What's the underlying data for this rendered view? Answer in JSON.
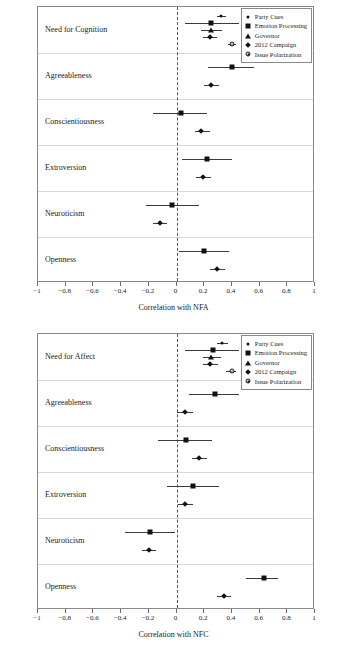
{
  "figure": {
    "legend_entries": [
      {
        "label": "Party Cues",
        "marker": "dot"
      },
      {
        "label": "Emotion Processing",
        "marker": "square"
      },
      {
        "label": "Governor",
        "marker": "triangle"
      },
      {
        "label": "2012 Campaign",
        "marker": "diamond"
      },
      {
        "label": "Issue Polarization",
        "marker": "open-circle"
      }
    ],
    "marker_color": "#111111",
    "grid_color": "#d8d8d8",
    "zero_line_color": "#555555"
  },
  "chart_data": [
    {
      "type": "scatter",
      "title": "",
      "xlabel": "Correlation with NFA",
      "ylabel": "Personality Trait Variable",
      "xlim": [
        -1,
        1
      ],
      "xticks": [
        -1,
        -0.8,
        -0.6,
        -0.4,
        -0.2,
        0,
        0.2,
        0.4,
        0.6,
        0.8,
        1
      ],
      "xticklabels": [
        "−1",
        "−0.8",
        "−0.6",
        "−0.4",
        "−0.2",
        "0",
        "0.2",
        "0.4",
        "0.6",
        "0.8",
        "1"
      ],
      "grid": true,
      "legend_position": "top-right",
      "groups": [
        {
          "label": "Need for Cognition",
          "points": [
            {
              "series": "Party Cues",
              "marker": "dot",
              "value": 0.32,
              "ci_low": 0.29,
              "ci_high": 0.36
            },
            {
              "series": "Emotion Processing",
              "marker": "square",
              "value": 0.25,
              "ci_low": 0.06,
              "ci_high": 0.45
            },
            {
              "series": "Governor",
              "marker": "triangle",
              "value": 0.25,
              "ci_low": 0.18,
              "ci_high": 0.33
            },
            {
              "series": "2012 Campaign",
              "marker": "diamond",
              "value": 0.24,
              "ci_low": 0.19,
              "ci_high": 0.29
            },
            {
              "series": "Issue Polarization",
              "marker": "open-circle",
              "value": 0.4,
              "ci_low": 0.37,
              "ci_high": 0.43
            }
          ]
        },
        {
          "label": "Agreeableness",
          "points": [
            {
              "series": "Emotion Processing",
              "marker": "square",
              "value": 0.4,
              "ci_low": 0.23,
              "ci_high": 0.56
            },
            {
              "series": "2012 Campaign",
              "marker": "diamond",
              "value": 0.25,
              "ci_low": 0.2,
              "ci_high": 0.31
            }
          ]
        },
        {
          "label": "Conscientiousness",
          "points": [
            {
              "series": "Emotion Processing",
              "marker": "square",
              "value": 0.03,
              "ci_low": -0.17,
              "ci_high": 0.22
            },
            {
              "series": "2012 Campaign",
              "marker": "diamond",
              "value": 0.18,
              "ci_low": 0.13,
              "ci_high": 0.24
            }
          ]
        },
        {
          "label": "Extroversion",
          "points": [
            {
              "series": "Emotion Processing",
              "marker": "square",
              "value": 0.22,
              "ci_low": 0.04,
              "ci_high": 0.4
            },
            {
              "series": "2012 Campaign",
              "marker": "diamond",
              "value": 0.19,
              "ci_low": 0.14,
              "ci_high": 0.25
            }
          ]
        },
        {
          "label": "Neuroticism",
          "points": [
            {
              "series": "Emotion Processing",
              "marker": "square",
              "value": -0.03,
              "ci_low": -0.22,
              "ci_high": 0.16
            },
            {
              "series": "2012 Campaign",
              "marker": "diamond",
              "value": -0.12,
              "ci_low": -0.17,
              "ci_high": -0.07
            }
          ]
        },
        {
          "label": "Openness",
          "points": [
            {
              "series": "Emotion Processing",
              "marker": "square",
              "value": 0.2,
              "ci_low": 0.02,
              "ci_high": 0.38
            },
            {
              "series": "2012 Campaign",
              "marker": "diamond",
              "value": 0.29,
              "ci_low": 0.24,
              "ci_high": 0.35
            }
          ]
        }
      ]
    },
    {
      "type": "scatter",
      "title": "",
      "xlabel": "Correlation with NFC",
      "ylabel": "Personality Trait Variable",
      "xlim": [
        -1,
        1
      ],
      "xticks": [
        -1,
        -0.8,
        -0.6,
        -0.4,
        -0.2,
        0,
        0.2,
        0.4,
        0.6,
        0.8,
        1
      ],
      "xticklabels": [
        "−1",
        "−0.8",
        "−0.6",
        "−0.4",
        "−0.2",
        "0",
        "0.2",
        "0.4",
        "0.6",
        "0.8",
        "1"
      ],
      "grid": true,
      "legend_position": "top-right",
      "groups": [
        {
          "label": "Need for Affect",
          "points": [
            {
              "series": "Party Cues",
              "marker": "dot",
              "value": 0.33,
              "ci_low": 0.29,
              "ci_high": 0.37
            },
            {
              "series": "Emotion Processing",
              "marker": "square",
              "value": 0.26,
              "ci_low": 0.06,
              "ci_high": 0.45
            },
            {
              "series": "Governor",
              "marker": "triangle",
              "value": 0.25,
              "ci_low": 0.19,
              "ci_high": 0.32
            },
            {
              "series": "2012 Campaign",
              "marker": "diamond",
              "value": 0.24,
              "ci_low": 0.19,
              "ci_high": 0.3
            },
            {
              "series": "Issue Polarization",
              "marker": "open-circle",
              "value": 0.4,
              "ci_low": 0.36,
              "ci_high": 0.43
            }
          ]
        },
        {
          "label": "Agreeableness",
          "points": [
            {
              "series": "Emotion Processing",
              "marker": "square",
              "value": 0.28,
              "ci_low": 0.09,
              "ci_high": 0.45
            },
            {
              "series": "2012 Campaign",
              "marker": "diamond",
              "value": 0.06,
              "ci_low": 0.0,
              "ci_high": 0.12
            }
          ]
        },
        {
          "label": "Conscientiousness",
          "points": [
            {
              "series": "Emotion Processing",
              "marker": "square",
              "value": 0.07,
              "ci_low": -0.13,
              "ci_high": 0.26
            },
            {
              "series": "2012 Campaign",
              "marker": "diamond",
              "value": 0.16,
              "ci_low": 0.11,
              "ci_high": 0.22
            }
          ]
        },
        {
          "label": "Extroversion",
          "points": [
            {
              "series": "Emotion Processing",
              "marker": "square",
              "value": 0.12,
              "ci_low": -0.07,
              "ci_high": 0.31
            },
            {
              "series": "2012 Campaign",
              "marker": "diamond",
              "value": 0.06,
              "ci_low": 0.01,
              "ci_high": 0.12
            }
          ]
        },
        {
          "label": "Neuroticism",
          "points": [
            {
              "series": "Emotion Processing",
              "marker": "square",
              "value": -0.19,
              "ci_low": -0.37,
              "ci_high": -0.01
            },
            {
              "series": "2012 Campaign",
              "marker": "diamond",
              "value": -0.2,
              "ci_low": -0.25,
              "ci_high": -0.15
            }
          ]
        },
        {
          "label": "Openness",
          "points": [
            {
              "series": "Emotion Processing",
              "marker": "square",
              "value": 0.63,
              "ci_low": 0.5,
              "ci_high": 0.73
            },
            {
              "series": "2012 Campaign",
              "marker": "diamond",
              "value": 0.34,
              "ci_low": 0.29,
              "ci_high": 0.39
            }
          ]
        }
      ]
    }
  ]
}
